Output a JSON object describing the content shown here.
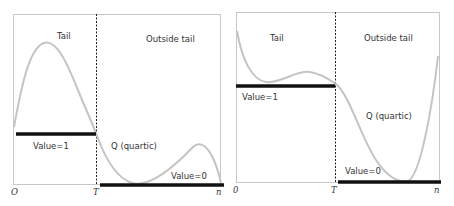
{
  "colors": {
    "frame": "#c8c8c8",
    "curve": "#c4c4c4",
    "bar": "#111111",
    "divider": "#222222",
    "text": "#333333"
  },
  "panels": [
    {
      "id": "left",
      "region_labels": {
        "tail": "Tail",
        "outside": "Outside tail"
      },
      "curve_label": "Q  (quartic)",
      "value_one_label": "Value=1",
      "value_zero_label": "Value=0",
      "axis_ticks": {
        "origin": "O",
        "threshold": "T",
        "end": "n"
      }
    },
    {
      "id": "right",
      "region_labels": {
        "tail": "Tail",
        "outside": "Outside tail"
      },
      "curve_label": "Q  (quartic)",
      "value_one_label": "Value=1",
      "value_zero_label": "Value=0",
      "axis_ticks": {
        "origin": "0",
        "threshold": "T",
        "end": "n"
      }
    }
  ]
}
